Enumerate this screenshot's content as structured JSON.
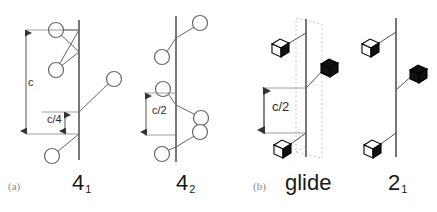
{
  "figure": {
    "background_color": "#ffffff",
    "line_color": "#555555",
    "dim_line_color": "#444444",
    "glide_plane_color": "#bbbbbb",
    "axis_color": "#555555"
  },
  "panels": [
    {
      "tag": "(a)",
      "tag_x": 8,
      "tag_y": 188,
      "diagrams": [
        {
          "name": "four-one-screw-axis",
          "symbol": "4",
          "subscript": "1",
          "symbol_x": 78,
          "symbol_y": 172,
          "axis": {
            "x": 79,
            "y1": 20,
            "y2": 160
          },
          "dimension": {
            "label": "c",
            "x": 26,
            "y1": 44,
            "y2": 135,
            "label_x": 29,
            "label_y": 83
          },
          "dimension2": {
            "label": "c/4",
            "x": 91,
            "y1": 112,
            "y2": 134,
            "label_x": 52,
            "label_y": 115
          },
          "nodes": [
            {
              "cx": 56,
              "cy": 30,
              "r": 7.5,
              "arm_x": 79,
              "arm_y": 30
            },
            {
              "cx": 56,
              "cy": 70,
              "r": 7.5,
              "arm_x": 79,
              "arm_y": 52
            },
            {
              "cx": 112,
              "cy": 79,
              "r": 7.5,
              "arm_x": 79,
              "arm_y": 112
            },
            {
              "cx": 53,
              "cy": 155,
              "r": 7.5,
              "arm_x": 79,
              "arm_y": 134
            }
          ],
          "cross_arms": [
            {
              "x1": 56,
              "y1": 30,
              "x2": 79,
              "y2": 52
            },
            {
              "x1": 56,
              "y1": 70,
              "x2": 79,
              "y2": 30
            }
          ]
        },
        {
          "name": "four-two-screw-axis",
          "symbol": "4",
          "subscript": "2",
          "symbol_x": 182,
          "symbol_y": 172,
          "axis": {
            "x": 176,
            "y1": 16,
            "y2": 162
          },
          "dimension": {
            "label": "c/2",
            "x": 148,
            "y1": 93,
            "y2": 135,
            "label_x": 152,
            "label_y": 107
          },
          "nodes": [
            {
              "cx": 198,
              "cy": 24,
              "r": 7.5,
              "arm_x": 176,
              "arm_y": 38
            },
            {
              "cx": 163,
              "cy": 56,
              "r": 7.5,
              "arm_x": 176,
              "arm_y": 38
            },
            {
              "cx": 164,
              "cy": 93,
              "r": 7.5,
              "arm_x": 176,
              "arm_y": 105
            },
            {
              "cx": 199,
              "cy": 117,
              "r": 7.5,
              "arm_x": 176,
              "arm_y": 105
            },
            {
              "cx": 198,
              "cy": 133,
              "r": 7.5,
              "arm_x": 176,
              "arm_y": 147
            },
            {
              "cx": 163,
              "cy": 153,
              "r": 7.5,
              "arm_x": 176,
              "arm_y": 147
            }
          ]
        }
      ]
    },
    {
      "tag": "(b)",
      "tag_x": 253,
      "tag_y": 188,
      "diagrams": [
        {
          "name": "glide-plane",
          "symbol": "glide",
          "subscript": "",
          "symbol_x": 288,
          "symbol_y": 172,
          "axis": {
            "x": 306,
            "y1": 19,
            "y2": 157
          },
          "glide_plane": {
            "x1": 293,
            "y1": 16,
            "x2": 320,
            "y2": 160,
            "skew": 10
          },
          "dimension": {
            "label": "c/2",
            "x": 277,
            "y1": 88,
            "y2": 133,
            "label_x": 281,
            "label_y": 102
          },
          "nodes": [
            {
              "cx": 281,
              "cy": 48,
              "size": 11,
              "arm_x": 306,
              "arm_y": 32,
              "fill": "white"
            },
            {
              "cx": 330,
              "cy": 65,
              "size": 11,
              "arm_x": 306,
              "arm_y": 88,
              "fill": "black"
            },
            {
              "cx": 281,
              "cy": 148,
              "size": 11,
              "arm_x": 306,
              "arm_y": 133,
              "fill": "white"
            }
          ]
        },
        {
          "name": "two-one-screw-axis",
          "symbol": "2",
          "subscript": "1",
          "symbol_x": 394,
          "symbol_y": 172,
          "axis": {
            "x": 396,
            "y1": 18,
            "y2": 157
          },
          "nodes": [
            {
              "cx": 371,
              "cy": 49,
              "size": 11,
              "arm_x": 396,
              "arm_y": 32,
              "fill": "white"
            },
            {
              "cx": 419,
              "cy": 71,
              "size": 11,
              "arm_x": 396,
              "arm_y": 90,
              "fill": "black"
            },
            {
              "cx": 371,
              "cy": 148,
              "size": 11,
              "arm_x": 396,
              "arm_y": 133,
              "fill": "white"
            }
          ]
        }
      ]
    }
  ],
  "labels": {
    "panel_a_tag": "(a)",
    "panel_b_tag": "(b)",
    "sym_41_base": "4",
    "sym_41_sub": "1",
    "sym_42_base": "4",
    "sym_42_sub": "2",
    "sym_glide": "glide",
    "sym_21_base": "2",
    "sym_21_sub": "1",
    "dim_c": "c",
    "dim_c_over_4": "c/4",
    "dim_c_over_2_a": "c/2",
    "dim_c_over_2_b": "c/2"
  }
}
